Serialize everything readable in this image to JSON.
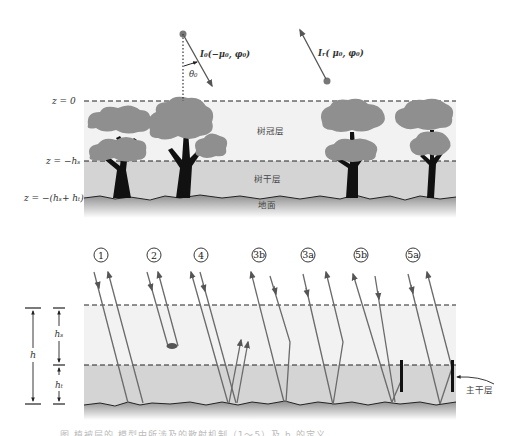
{
  "top_diagram": {
    "incident_label": "I₀(−μ₀,  φ₀)",
    "reflected_label": "Iᵣ( μ₀,  φ₀)",
    "angle_label": "θ₀",
    "z_labels": [
      "z = 0",
      "z = −hₛ",
      "z = −(hₛ+ hₜ)"
    ],
    "layer_labels": {
      "canopy": "树冠层",
      "trunk": "树干层",
      "ground": "地面"
    },
    "colors": {
      "canopy_bg": "#f2f2f2",
      "trunk_bg": "#d4d4d4",
      "foliage": "#8f8f8f",
      "trunk": "#111111",
      "ground_dark": "#9a9a9a"
    }
  },
  "bottom_diagram": {
    "mechanisms": [
      "①",
      "②",
      "④",
      "③b",
      "③a",
      "⑤b",
      "⑤a"
    ],
    "mechanism_ids": [
      "1",
      "2",
      "4",
      "3b",
      "3a",
      "5b",
      "5a"
    ],
    "height_labels": {
      "total": "h",
      "canopy": "hₛ",
      "trunk": "hₜ"
    },
    "main_trunk_label": "主干层"
  },
  "caption": {
    "text": "图        植被层的            模型中所涉及的散射机制（1～5）及 h      的定义"
  }
}
